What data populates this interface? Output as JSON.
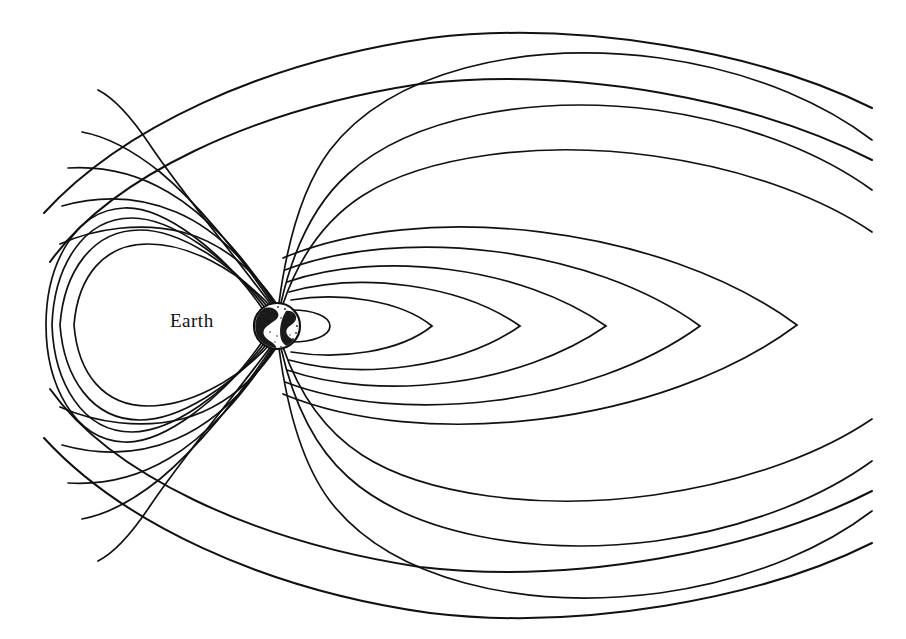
{
  "figure": {
    "background_color": "#ffffff",
    "line_color": "#111111",
    "width": 906,
    "height": 639
  },
  "labels": {
    "earth": "Earth"
  },
  "earth": {
    "center_x": 277,
    "center_y": 326,
    "radius": 23,
    "icon": "earth-globe-icon"
  },
  "chart_data": {
    "type": "line",
    "xlabel": "",
    "ylabel": "",
    "grid": false,
    "legend": "none",
    "symmetry_axis_y": 325,
    "annotations": [
      {
        "text": "Earth",
        "x": 201,
        "y": 326
      }
    ],
    "series": [
      {
        "name": "outer-bow-shock-upper",
        "kind": "open-boundary",
        "path": "M 44,213 C 120,130 260,62 430,38 C 580,20 760,52 872,108"
      },
      {
        "name": "outer-bow-shock-lower",
        "kind": "open-boundary",
        "path": "M 44,438 C 120,521 260,589 430,613 C 580,631 760,599 872,543"
      },
      {
        "name": "magnetopause-upper",
        "kind": "open-boundary",
        "path": "M 50,262 C 110,178 250,110 420,84 C 575,66 755,100 872,160"
      },
      {
        "name": "magnetopause-lower",
        "kind": "open-boundary",
        "path": "M 50,389 C 110,473 250,541 420,567 C 575,585 755,551 872,491"
      },
      {
        "name": "tail-lobe-open-1-upper",
        "kind": "open-polar",
        "path": "M 272,306 C 230,250 180,190 150,145 C 128,112 110,96 98,90"
      },
      {
        "name": "tail-lobe-open-2-upper",
        "kind": "open-polar",
        "path": "M 273,305 C 238,252 196,202 160,172 C 130,148 104,136 82,132"
      },
      {
        "name": "tail-lobe-open-3-upper",
        "kind": "open-polar",
        "path": "M 274,304 C 244,256 206,214 168,192 C 134,172 100,166 68,168"
      },
      {
        "name": "tail-lobe-open-4-upper",
        "kind": "open-polar",
        "path": "M 275,304 C 248,262 214,228 176,212 C 138,196 98,196 62,206"
      },
      {
        "name": "tail-lobe-open-5-upper",
        "kind": "open-polar",
        "path": "M 276,303 C 252,268 220,242 182,232 C 142,222 96,228 60,244"
      },
      {
        "name": "open-to-tail-1-upper",
        "kind": "open-tail",
        "path": "M 279,303 C 286,250 300,190 330,150 C 390,72 520,40 660,58 C 760,72 830,108 872,140"
      },
      {
        "name": "open-to-tail-2-upper",
        "kind": "open-tail",
        "path": "M 281,303 C 292,254 312,206 348,174 C 410,118 530,94 656,110 C 756,124 828,158 872,190"
      },
      {
        "name": "open-to-tail-3-upper",
        "kind": "open-tail",
        "path": "M 283,304 C 298,260 322,222 362,196 C 424,156 540,140 654,156 C 754,170 828,202 872,232"
      },
      {
        "name": "dayside-closed-loop-1",
        "kind": "closed-dayside",
        "path": "M 272,308 C 236,268 188,244 148,244 C 104,244 78,276 74,325 C 78,374 104,406 148,406 C 188,406 236,382 272,342"
      },
      {
        "name": "dayside-closed-loop-2",
        "kind": "closed-dayside",
        "path": "M 270,310 C 232,262 178,230 140,230 C 92,230 64,272 60,325 C 64,378 92,420 140,420 C 178,420 232,388 270,340"
      },
      {
        "name": "dayside-closed-loop-3",
        "kind": "closed-dayside",
        "path": "M 268,312 C 228,256 170,218 132,218 C 82,218 54,268 52,325 C 54,382 82,432 132,432 C 170,432 228,394 268,338"
      },
      {
        "name": "dayside-closed-loop-4",
        "kind": "closed-dayside",
        "path": "M 266,314 C 224,250 162,206 124,208 C 74,210 46,266 46,325 C 46,384 74,440 124,442 C 162,444 224,400 266,336"
      },
      {
        "name": "nightside-small-loop",
        "kind": "closed-nightside",
        "path": "M 292,310 C 312,310 330,316 330,326 C 330,336 312,342 292,342"
      },
      {
        "name": "nightside-closed-loop-1",
        "kind": "closed-nightside",
        "path": "M 291,300 C 340,292 400,300 432,326 C 400,352 340,360 291,352"
      },
      {
        "name": "nightside-closed-loop-2",
        "kind": "closed-nightside",
        "path": "M 289,292 C 360,272 460,284 520,326 C 460,368 360,380 289,360"
      },
      {
        "name": "nightside-closed-loop-3",
        "kind": "closed-nightside",
        "path": "M 287,282 C 380,250 520,266 606,326 C 520,386 380,402 287,370"
      },
      {
        "name": "nightside-closed-loop-4",
        "kind": "closed-nightside",
        "path": "M 285,270 C 400,226 590,246 700,326 C 590,406 400,426 285,382"
      },
      {
        "name": "nightside-closed-loop-5",
        "kind": "closed-nightside",
        "path": "M 283,258 C 420,200 660,224 797,325 C 660,427 420,451 283,394"
      },
      {
        "name": "tail-lobe-open-1-lower",
        "kind": "open-polar",
        "path": "M 272,345 C 230,401 180,461 150,506 C 128,539 110,555 98,561"
      },
      {
        "name": "tail-lobe-open-2-lower",
        "kind": "open-polar",
        "path": "M 273,346 C 238,399 196,449 160,479 C 130,503 104,515 82,519"
      },
      {
        "name": "tail-lobe-open-3-lower",
        "kind": "open-polar",
        "path": "M 274,347 C 244,395 206,437 168,459 C 134,479 100,485 68,483"
      },
      {
        "name": "tail-lobe-open-4-lower",
        "kind": "open-polar",
        "path": "M 275,347 C 248,389 214,423 176,439 C 138,455 98,455 62,445"
      },
      {
        "name": "tail-lobe-open-5-lower",
        "kind": "open-polar",
        "path": "M 276,348 C 252,383 220,409 182,419 C 142,429 96,423 60,407"
      },
      {
        "name": "open-to-tail-1-lower",
        "kind": "open-tail",
        "path": "M 279,348 C 286,401 300,461 330,501 C 390,579 520,611 660,593 C 760,579 830,543 872,511"
      },
      {
        "name": "open-to-tail-2-lower",
        "kind": "open-tail",
        "path": "M 281,348 C 292,397 312,445 348,477 C 410,533 530,557 656,541 C 756,527 828,493 872,461"
      },
      {
        "name": "open-to-tail-3-lower",
        "kind": "open-tail",
        "path": "M 283,347 C 298,391 322,429 362,455 C 424,495 540,511 654,495 C 754,481 828,449 872,419"
      }
    ]
  }
}
